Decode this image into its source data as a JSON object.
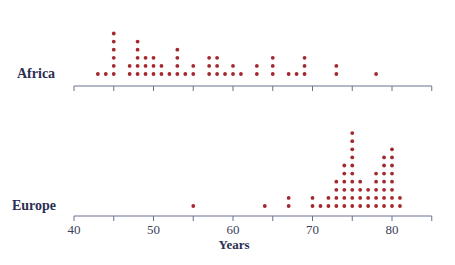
{
  "chart_data": {
    "type": "scatter",
    "subtype": "dot-plot",
    "title": "",
    "xlabel": "Years",
    "ylabel": "",
    "xlim": [
      40,
      85
    ],
    "x_ticks": [
      40,
      45,
      50,
      55,
      60,
      65,
      70,
      75,
      80,
      85
    ],
    "x_tick_labels": [
      "40",
      "50",
      "60",
      "70",
      "80"
    ],
    "grid": false,
    "legend": null,
    "series": [
      {
        "name": "Africa",
        "color": "#a3282e",
        "points": [
          {
            "x": 43,
            "count": 1
          },
          {
            "x": 44,
            "count": 1
          },
          {
            "x": 45,
            "count": 6
          },
          {
            "x": 47,
            "count": 2
          },
          {
            "x": 48,
            "count": 5
          },
          {
            "x": 49,
            "count": 3
          },
          {
            "x": 50,
            "count": 3
          },
          {
            "x": 51,
            "count": 2
          },
          {
            "x": 52,
            "count": 1
          },
          {
            "x": 53,
            "count": 4
          },
          {
            "x": 54,
            "count": 1
          },
          {
            "x": 55,
            "count": 2
          },
          {
            "x": 57,
            "count": 3
          },
          {
            "x": 58,
            "count": 3
          },
          {
            "x": 59,
            "count": 1
          },
          {
            "x": 60,
            "count": 2
          },
          {
            "x": 61,
            "count": 1
          },
          {
            "x": 63,
            "count": 2
          },
          {
            "x": 65,
            "count": 3
          },
          {
            "x": 67,
            "count": 1
          },
          {
            "x": 68,
            "count": 1
          },
          {
            "x": 69,
            "count": 3
          },
          {
            "x": 73,
            "count": 2
          },
          {
            "x": 78,
            "count": 1
          }
        ]
      },
      {
        "name": "Europe",
        "color": "#a3282e",
        "points": [
          {
            "x": 55,
            "count": 1
          },
          {
            "x": 64,
            "count": 1
          },
          {
            "x": 67,
            "count": 2
          },
          {
            "x": 70,
            "count": 2
          },
          {
            "x": 71,
            "count": 1
          },
          {
            "x": 72,
            "count": 2
          },
          {
            "x": 73,
            "count": 4
          },
          {
            "x": 74,
            "count": 6
          },
          {
            "x": 75,
            "count": 10
          },
          {
            "x": 76,
            "count": 4
          },
          {
            "x": 77,
            "count": 3
          },
          {
            "x": 78,
            "count": 5
          },
          {
            "x": 79,
            "count": 7
          },
          {
            "x": 80,
            "count": 8
          },
          {
            "x": 81,
            "count": 2
          }
        ]
      }
    ]
  },
  "labels": {
    "africa": "Africa",
    "europe": "Europe",
    "x_axis_title": "Years"
  },
  "colors": {
    "dot": "#a3282e",
    "axis": "#6b7090",
    "label": "#2b2f52"
  }
}
